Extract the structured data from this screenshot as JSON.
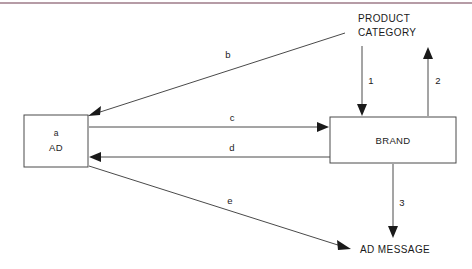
{
  "diagram": {
    "title_bar_color": "#a98b97",
    "background": "#ffffff",
    "nodes": [
      {
        "id": "ad",
        "shape": "rectangle",
        "tag": "a",
        "label": "AD"
      },
      {
        "id": "product-category",
        "shape": "text",
        "label_line1": "PRODUCT",
        "label_line2": "CATEGORY"
      },
      {
        "id": "brand",
        "shape": "rectangle",
        "label": "BRAND"
      },
      {
        "id": "ad-message",
        "shape": "text",
        "label": "AD MESSAGE"
      }
    ],
    "edges": [
      {
        "id": "b",
        "label": "b",
        "from": "product-category",
        "to": "ad",
        "direction": "to-ad"
      },
      {
        "id": "c",
        "label": "c",
        "from": "ad",
        "to": "brand",
        "direction": "to-brand"
      },
      {
        "id": "d",
        "label": "d",
        "from": "brand",
        "to": "ad",
        "direction": "to-ad"
      },
      {
        "id": "e",
        "label": "e",
        "from": "ad",
        "to": "ad-message",
        "direction": "to-ad-message"
      },
      {
        "id": "1",
        "label": "1",
        "from": "product-category",
        "to": "brand",
        "direction": "down"
      },
      {
        "id": "2",
        "label": "2",
        "from": "brand",
        "to": "product-category",
        "direction": "up"
      },
      {
        "id": "3",
        "label": "3",
        "from": "brand",
        "to": "ad-message",
        "direction": "down"
      }
    ]
  }
}
